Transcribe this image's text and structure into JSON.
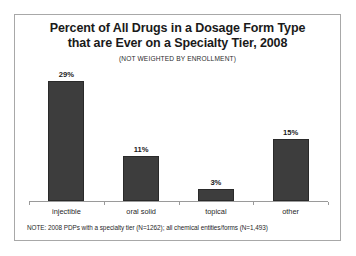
{
  "chart_data": {
    "type": "bar",
    "title": "Percent of All Drugs in a Dosage Form Type that are Ever on a Specialty Tier, 2008",
    "title_line1": "Percent of All Drugs in a Dosage Form Type",
    "title_line2": "that are Ever on a Specialty Tier, 2008",
    "subtitle": "(NOT WEIGHTED BY ENROLLMENT)",
    "categories": [
      "injectible",
      "oral solid",
      "topical",
      "other"
    ],
    "values": [
      29,
      11,
      3,
      15
    ],
    "value_labels": [
      "29%",
      "11%",
      "3%",
      "15%"
    ],
    "xlabel": "",
    "ylabel": "",
    "ylim": [
      0,
      32
    ],
    "grid": false,
    "legend": null,
    "bar_color": "#3d3d3d",
    "axis_color": "#9a9a9a",
    "note": "NOTE: 2008 PDPs with a specialty tier (N=1262); all chemical entities/forms (N=1,493)"
  }
}
